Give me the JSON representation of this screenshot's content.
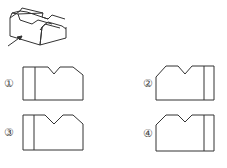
{
  "figure": {
    "isometric_view": "isometric-block-with-v-groove-and-chamfer",
    "arrow": "view-direction-arrow"
  },
  "options": [
    {
      "label": "①",
      "notch_side": "center-left",
      "divider_side": "left",
      "chamfer_side": "right"
    },
    {
      "label": "②",
      "notch_side": "center-right",
      "divider_side": "right",
      "chamfer_side": "left"
    },
    {
      "label": "③",
      "notch_side": "center",
      "divider_side": "left",
      "chamfer_side": "right",
      "notch_depth": "deep"
    },
    {
      "label": "④",
      "notch_side": "center",
      "divider_side": "right",
      "chamfer_side": "left",
      "notch_depth": "shallow"
    }
  ],
  "colors": {
    "line": "#333333",
    "background": "#ffffff"
  }
}
